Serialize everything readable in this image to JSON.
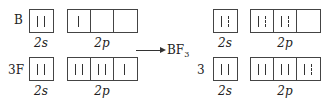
{
  "left": {
    "rows": [
      {
        "atom_label": "B",
        "s_label": "2s",
        "p_label": "2p",
        "s_orbital": [
          "solid",
          "solid"
        ],
        "p_orbitals": [
          [
            "solid"
          ],
          [],
          []
        ]
      },
      {
        "atom_label": "3F",
        "s_label": "2s",
        "p_label": "2p",
        "s_orbital": [
          "solid",
          "solid"
        ],
        "p_orbitals": [
          [
            "solid",
            "solid"
          ],
          [
            "solid",
            "solid"
          ],
          [
            "solid"
          ]
        ]
      }
    ]
  },
  "arrow": {
    "product_label": "BF",
    "product_subscript": "3"
  },
  "right": {
    "rows": [
      {
        "atom_label": "",
        "s_label": "2s",
        "p_label": "2p",
        "s_orbital": [
          "solid",
          "dashed"
        ],
        "p_orbitals": [
          [
            "solid",
            "dashed"
          ],
          [
            "solid",
            "dashed"
          ],
          []
        ]
      },
      {
        "atom_label": "3",
        "s_label": "2s",
        "p_label": "2p",
        "s_orbital": [
          "solid",
          "solid"
        ],
        "p_orbitals": [
          [
            "solid",
            "solid"
          ],
          [
            "solid",
            "solid"
          ],
          [
            "solid",
            "dashed"
          ]
        ]
      }
    ]
  },
  "legend": {
    "solid": "own electron",
    "dashed": "electron shared from bonding partner"
  }
}
